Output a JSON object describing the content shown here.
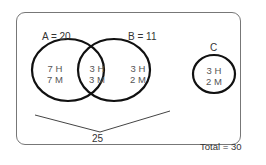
{
  "diagram": {
    "type": "venn",
    "sets": [
      {
        "name": "A",
        "label": "A = 20"
      },
      {
        "name": "B",
        "label": "B = 11"
      },
      {
        "name": "C",
        "label": "C"
      }
    ],
    "regions": {
      "a_only": {
        "h": "7 H",
        "m": "7 M"
      },
      "a_and_b": {
        "h": "3 H",
        "m": "3 M"
      },
      "b_only": {
        "h": "3 H",
        "m": "2 M"
      },
      "c_only": {
        "h": "3 H",
        "m": "2 M"
      }
    },
    "brace_label": "25",
    "total_label": "Total = 30"
  }
}
